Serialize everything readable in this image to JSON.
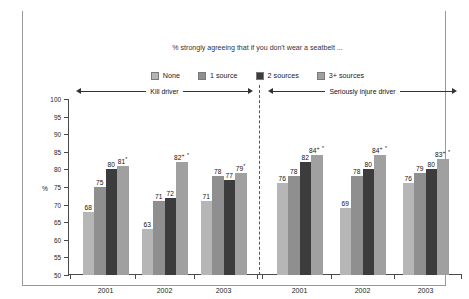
{
  "figure": {
    "title": "Figure 4: Multiplier effect on attitudes to road safety – seat belts",
    "subtitle": "% strongly agreeing that if you don't wear a seatbelt ..."
  },
  "legend": {
    "items": [
      {
        "label": "None",
        "color": "#b6b6b6"
      },
      {
        "label": "1 source",
        "color": "#8f8f8f"
      },
      {
        "label": "2 sources",
        "color": "#3c3c3c"
      },
      {
        "label": "3+ sources",
        "color": "#a0a0a0"
      }
    ]
  },
  "axes": {
    "y_label": "%",
    "y_ticks": [
      "100",
      "95",
      "90",
      "85",
      "80",
      "75",
      "70",
      "65",
      "60",
      "55",
      "50"
    ]
  },
  "panels": [
    {
      "title": "Kill driver"
    },
    {
      "title": "Seriously injure driver"
    }
  ],
  "chart_data": {
    "type": "bar",
    "title": "Figure 4: Multiplier effect on attitudes to road safety – seat belts",
    "subtitle": "% strongly agreeing that if you don't wear a seatbelt ...",
    "xlabel": "",
    "ylabel": "%",
    "ylim": [
      50,
      100
    ],
    "ytick_step": 5,
    "grid": false,
    "legend_position": "top-center",
    "panels": [
      {
        "name": "Kill driver",
        "categories": [
          "2001",
          "2002",
          "2003"
        ],
        "series": [
          {
            "name": "None",
            "values": [
              68,
              63,
              71
            ],
            "labels": [
              "68",
              "63",
              "71"
            ]
          },
          {
            "name": "1 source",
            "values": [
              75,
              71,
              78
            ],
            "labels": [
              "75",
              "71",
              "78"
            ]
          },
          {
            "name": "2 sources",
            "values": [
              80,
              72,
              77
            ],
            "labels": [
              "80",
              "72",
              "77"
            ]
          },
          {
            "name": "3+ sources",
            "values": [
              81,
              82,
              79
            ],
            "labels": [
              "81",
              "82",
              "79"
            ],
            "marks": [
              "*",
              "+ *",
              "*"
            ]
          }
        ]
      },
      {
        "name": "Seriously injure driver",
        "categories": [
          "2001",
          "2002",
          "2003"
        ],
        "series": [
          {
            "name": "None",
            "values": [
              76,
              69,
              76
            ],
            "labels": [
              "76",
              "69",
              "76"
            ]
          },
          {
            "name": "1 source",
            "values": [
              78,
              78,
              79
            ],
            "labels": [
              "78",
              "78",
              "79"
            ]
          },
          {
            "name": "2 sources",
            "values": [
              82,
              80,
              80
            ],
            "labels": [
              "82",
              "80",
              "80"
            ]
          },
          {
            "name": "3+ sources",
            "values": [
              84,
              84,
              83
            ],
            "labels": [
              "84",
              "84",
              "83"
            ],
            "marks": [
              "+ *",
              "+ *",
              "+ *"
            ]
          }
        ]
      }
    ]
  }
}
